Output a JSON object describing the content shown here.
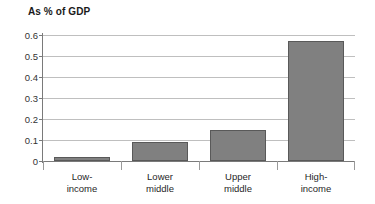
{
  "chart_data": {
    "type": "bar",
    "title": "As % of GDP",
    "subtitle": "",
    "xlabel": "",
    "ylabel": "",
    "categories": [
      "Low-income",
      "Lower middle",
      "Upper middle",
      "High-income"
    ],
    "category_lines": [
      [
        "Low-",
        "income"
      ],
      [
        "Lower",
        "middle"
      ],
      [
        "Upper",
        "middle"
      ],
      [
        "High-",
        "income"
      ]
    ],
    "values": [
      0.02,
      0.09,
      0.15,
      0.57
    ],
    "ylim": [
      0,
      0.6
    ],
    "ytick_labels": [
      "0.6",
      "0.5",
      "0.4",
      "0.3",
      "0.2",
      "0.1",
      "0"
    ],
    "ytick_values": [
      0.6,
      0.5,
      0.4,
      0.3,
      0.2,
      0.1,
      0
    ],
    "grid": true,
    "grid_axis": "y",
    "legend": false,
    "legend_position": "none",
    "bar_color": "#808080",
    "bar_border_color": "#595959",
    "gridline_color": "#bfbfbf",
    "axis_color": "#7a7a7a",
    "background": "#ffffff"
  }
}
